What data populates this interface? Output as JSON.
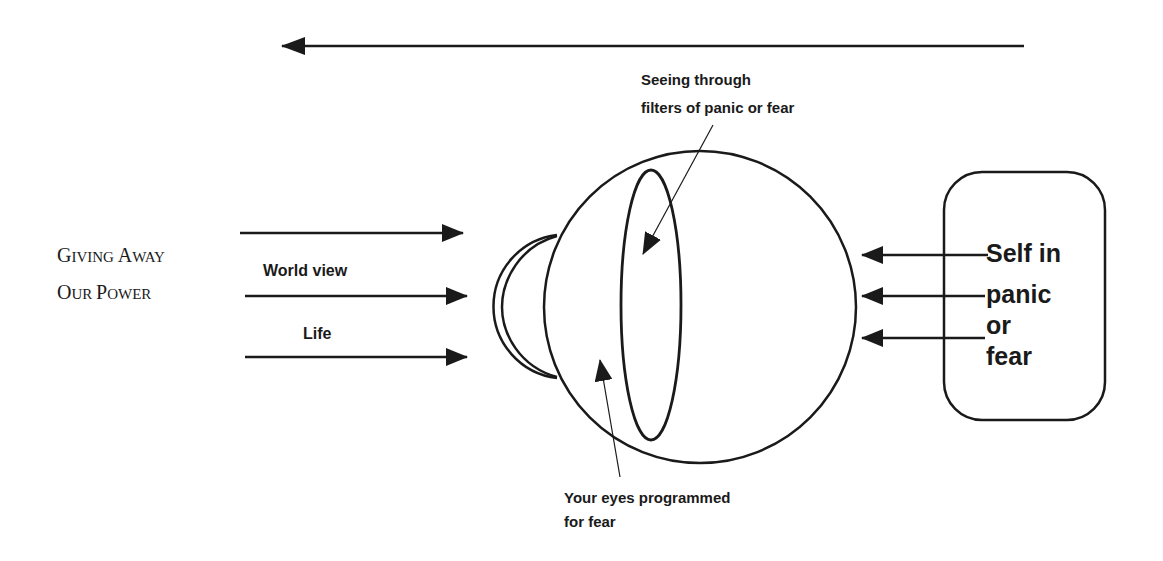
{
  "diagram": {
    "colors": {
      "ink": "#1a1a1a",
      "background": "#ffffff"
    },
    "title": {
      "line1_cap": "G",
      "line1_rest": "IVING ",
      "line1b_cap": "A",
      "line1b_rest": "WAY",
      "line2_cap": "O",
      "line2_rest": "UR ",
      "line2b_cap": "P",
      "line2b_rest": "OWER",
      "full_text": "Giving Away Our Power"
    },
    "left_arrows": {
      "labels": [
        "World view",
        "Life"
      ],
      "count": 3,
      "direction": "right"
    },
    "top_arrow": {
      "direction": "left"
    },
    "eye": {
      "parts": [
        "eyeball",
        "cornea",
        "lens-filter"
      ]
    },
    "annotations": {
      "filters_line1": "Seeing  through",
      "filters_line2": "filters of panic or fear",
      "programmed_line1": "Your  eyes  programmed",
      "programmed_line2": "for  fear"
    },
    "self_box": {
      "lines": [
        "Self in",
        "panic",
        "or",
        "fear"
      ],
      "arrow_count": 3,
      "arrow_direction": "left"
    }
  }
}
